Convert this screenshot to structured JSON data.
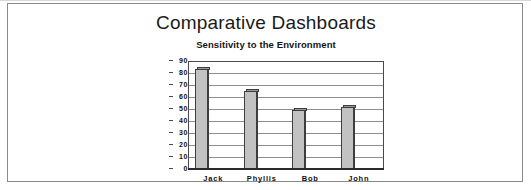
{
  "document": {
    "title": "Comparative Dashboards",
    "subtitle": "Sensitivity to the Environment"
  },
  "chart_data": {
    "type": "bar",
    "title": "Comparative Dashboards",
    "subtitle": "Sensitivity to the Environment",
    "categories": [
      "Jack",
      "Phyllis",
      "Bob",
      "John"
    ],
    "values": [
      84,
      66,
      50,
      52
    ],
    "xlabel": "",
    "ylabel": "",
    "ylim": [
      0,
      90
    ],
    "ytick_labels": [
      "90",
      "80",
      "70",
      "60",
      "50",
      "40",
      "30",
      "20",
      "10",
      "0"
    ],
    "ytick_values": [
      90,
      80,
      70,
      60,
      50,
      40,
      30,
      20,
      10,
      0
    ],
    "grid": true,
    "legend": "none",
    "series": [
      {
        "name": "Sensitivity to the Environment",
        "values": [
          84,
          66,
          50,
          52
        ]
      }
    ],
    "bar_fill_color": "#c2c2c2",
    "bar_edge_color": "#3d3d3d",
    "plot_border_color": "#4a4a4a",
    "gridline_color": "#8e8e8e",
    "text_color": "#101010"
  }
}
